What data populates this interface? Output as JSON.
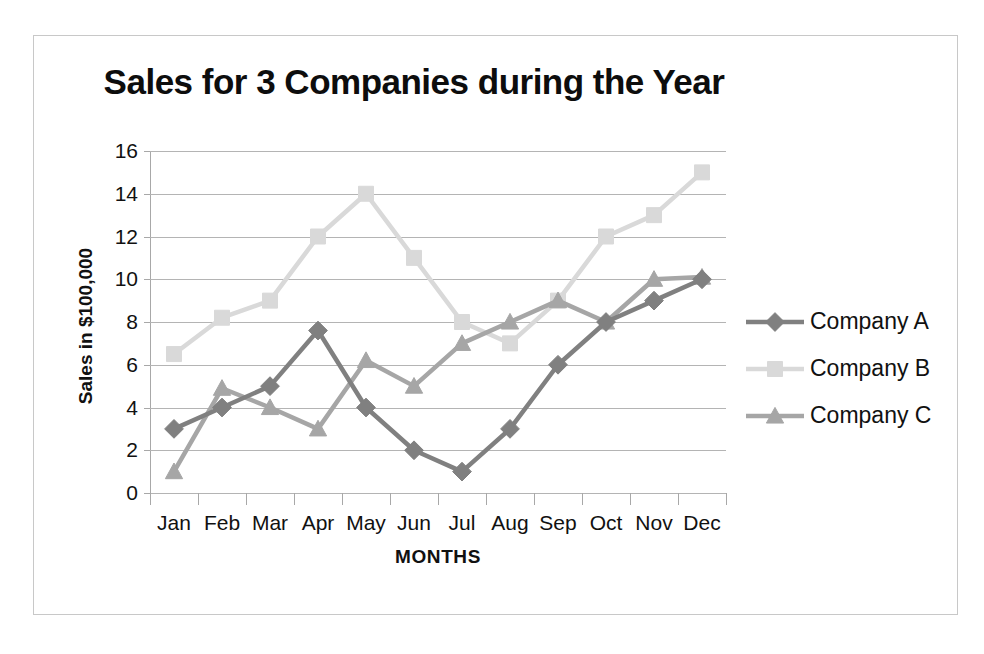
{
  "chart_data": {
    "type": "line",
    "title": "Sales for 3 Companies during the Year",
    "xlabel": "MONTHS",
    "ylabel": "Sales in $100,000",
    "categories": [
      "Jan",
      "Feb",
      "Mar",
      "Apr",
      "May",
      "Jun",
      "Jul",
      "Aug",
      "Sep",
      "Oct",
      "Nov",
      "Dec"
    ],
    "ylim": [
      0,
      16
    ],
    "ytick_step": 2,
    "yticks": [
      0,
      2,
      4,
      6,
      8,
      10,
      12,
      14,
      16
    ],
    "grid": true,
    "legend_position": "right",
    "series": [
      {
        "name": "Company A",
        "marker": "diamond",
        "color": "#808080",
        "values": [
          3,
          4,
          5,
          7.6,
          4,
          2,
          1,
          3,
          6,
          8,
          9,
          10
        ]
      },
      {
        "name": "Company B",
        "marker": "square",
        "color": "#d9d9d9",
        "values": [
          6.5,
          8.2,
          9,
          12,
          14,
          11,
          8,
          7,
          9,
          12,
          13,
          15
        ]
      },
      {
        "name": "Company C",
        "marker": "triangle",
        "color": "#a6a6a6",
        "values": [
          1,
          4.9,
          4,
          3,
          6.2,
          5,
          7,
          8,
          9,
          8,
          10,
          10.1
        ]
      }
    ]
  },
  "frame": {
    "border_color": "#c8c8c8",
    "background": "#ffffff",
    "gridline_color": "#b4b4b4",
    "axis_color": "#a8a8a8",
    "text_color": "#111111"
  }
}
